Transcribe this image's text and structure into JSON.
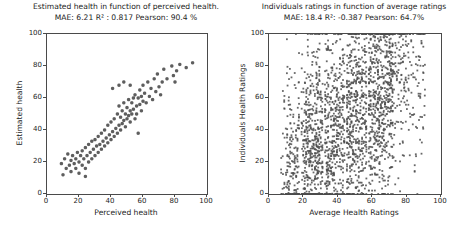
{
  "figure": {
    "background": "#ffffff",
    "text_color": "#1c1c1c",
    "axis_color": "#4a4a4a",
    "marker_color": "#4d4d4d"
  },
  "chart_data": [
    {
      "type": "scatter",
      "title": "Estimated health in function of perceived health.",
      "subtitle": "MAE: 6.21 R² : 0.817 Pearson: 90.4 %",
      "xlabel": "Perceived health",
      "ylabel": "Estimated health",
      "xlim": [
        0,
        100
      ],
      "ylim": [
        0,
        100
      ],
      "xticks": [
        0,
        20,
        40,
        60,
        80,
        100
      ],
      "yticks": [
        0,
        20,
        40,
        60,
        80,
        100
      ],
      "grid": false,
      "legend": null,
      "marker": {
        "shape": "circle",
        "size_px": 3.4,
        "color": "#4d4d4d",
        "alpha": 0.9
      },
      "points": [
        [
          9,
          19
        ],
        [
          10,
          12
        ],
        [
          11,
          22
        ],
        [
          12,
          16
        ],
        [
          13,
          25
        ],
        [
          14,
          18
        ],
        [
          15,
          21
        ],
        [
          15,
          14
        ],
        [
          16,
          24
        ],
        [
          17,
          19
        ],
        [
          18,
          22
        ],
        [
          18,
          16
        ],
        [
          19,
          26
        ],
        [
          20,
          20
        ],
        [
          20,
          13
        ],
        [
          21,
          24
        ],
        [
          22,
          18
        ],
        [
          22,
          27
        ],
        [
          23,
          22
        ],
        [
          24,
          16
        ],
        [
          24,
          11
        ],
        [
          24,
          29
        ],
        [
          25,
          24
        ],
        [
          26,
          20
        ],
        [
          26,
          31
        ],
        [
          27,
          26
        ],
        [
          28,
          22
        ],
        [
          28,
          33
        ],
        [
          29,
          28
        ],
        [
          30,
          24
        ],
        [
          30,
          34
        ],
        [
          31,
          30
        ],
        [
          32,
          26
        ],
        [
          32,
          36
        ],
        [
          33,
          31
        ],
        [
          34,
          28
        ],
        [
          34,
          38
        ],
        [
          35,
          33
        ],
        [
          36,
          30
        ],
        [
          36,
          40
        ],
        [
          37,
          35
        ],
        [
          38,
          32
        ],
        [
          38,
          43
        ],
        [
          39,
          37
        ],
        [
          40,
          34
        ],
        [
          40,
          45
        ],
        [
          41,
          39
        ],
        [
          41,
          66
        ],
        [
          42,
          36
        ],
        [
          42,
          47
        ],
        [
          43,
          41
        ],
        [
          44,
          38
        ],
        [
          44,
          50
        ],
        [
          45,
          43
        ],
        [
          45,
          55
        ],
        [
          45,
          68
        ],
        [
          46,
          48
        ],
        [
          46,
          40
        ],
        [
          47,
          52
        ],
        [
          47,
          44
        ],
        [
          48,
          57
        ],
        [
          48,
          46
        ],
        [
          48,
          70
        ],
        [
          49,
          50
        ],
        [
          49,
          42
        ],
        [
          50,
          54
        ],
        [
          50,
          47
        ],
        [
          51,
          59
        ],
        [
          51,
          49
        ],
        [
          52,
          52
        ],
        [
          52,
          45
        ],
        [
          52,
          68
        ],
        [
          53,
          57
        ],
        [
          53,
          50
        ],
        [
          54,
          60
        ],
        [
          54,
          53
        ],
        [
          55,
          47
        ],
        [
          55,
          62
        ],
        [
          56,
          55
        ],
        [
          56,
          50
        ],
        [
          57,
          60
        ],
        [
          57,
          38
        ],
        [
          58,
          65
        ],
        [
          58,
          56
        ],
        [
          59,
          61
        ],
        [
          59,
          52
        ],
        [
          60,
          68
        ],
        [
          60,
          58
        ],
        [
          61,
          63
        ],
        [
          62,
          57
        ],
        [
          63,
          70
        ],
        [
          64,
          61
        ],
        [
          65,
          66
        ],
        [
          66,
          59
        ],
        [
          67,
          72
        ],
        [
          68,
          64
        ],
        [
          69,
          75
        ],
        [
          70,
          67
        ],
        [
          71,
          62
        ],
        [
          72,
          70
        ],
        [
          73,
          78
        ],
        [
          75,
          72
        ],
        [
          78,
          80
        ],
        [
          79,
          74
        ],
        [
          80,
          70
        ],
        [
          81,
          77
        ],
        [
          83,
          81
        ],
        [
          87,
          79
        ],
        [
          91,
          82
        ]
      ]
    },
    {
      "type": "scatter",
      "title": "Individuals ratings in function of average ratings",
      "subtitle": "MAE: 18.4 R²: -0.387  Pearson: 64.7%",
      "xlabel": "Average Health Ratings",
      "ylabel": "Individuals Health Ratings",
      "xlim": [
        0,
        100
      ],
      "ylim": [
        0,
        100
      ],
      "xticks": [
        0,
        20,
        40,
        60,
        80,
        100
      ],
      "yticks": [
        0,
        20,
        40,
        60,
        80,
        100
      ],
      "grid": false,
      "legend": null,
      "marker": {
        "shape": "square",
        "size_px": 1.8,
        "color": "#4d4d4d",
        "alpha": 0.85
      },
      "point_cloud": {
        "description": "dense cloud of individual ratings in vertical columns at discrete average-rating values",
        "seed": 7,
        "x_start": 7.2,
        "x_step": 0.85,
        "x_end": 91,
        "x_jitter": 0.2,
        "gap_columns": [
          18.5,
          32,
          45,
          57.5
        ],
        "column_counts": [
          {
            "x_min": 7,
            "x_max": 10,
            "count": 7
          },
          {
            "x_min": 10,
            "x_max": 20,
            "count": 18
          },
          {
            "x_min": 20,
            "x_max": 72,
            "count": 34
          },
          {
            "x_min": 72,
            "x_max": 80,
            "count": 11
          },
          {
            "x_min": 80,
            "x_max": 91,
            "count": 7
          }
        ],
        "y_model": {
          "intercept": 12,
          "slope": 0.75,
          "sigma": 30,
          "clip_min": 0,
          "clip_max": 100
        }
      }
    }
  ]
}
